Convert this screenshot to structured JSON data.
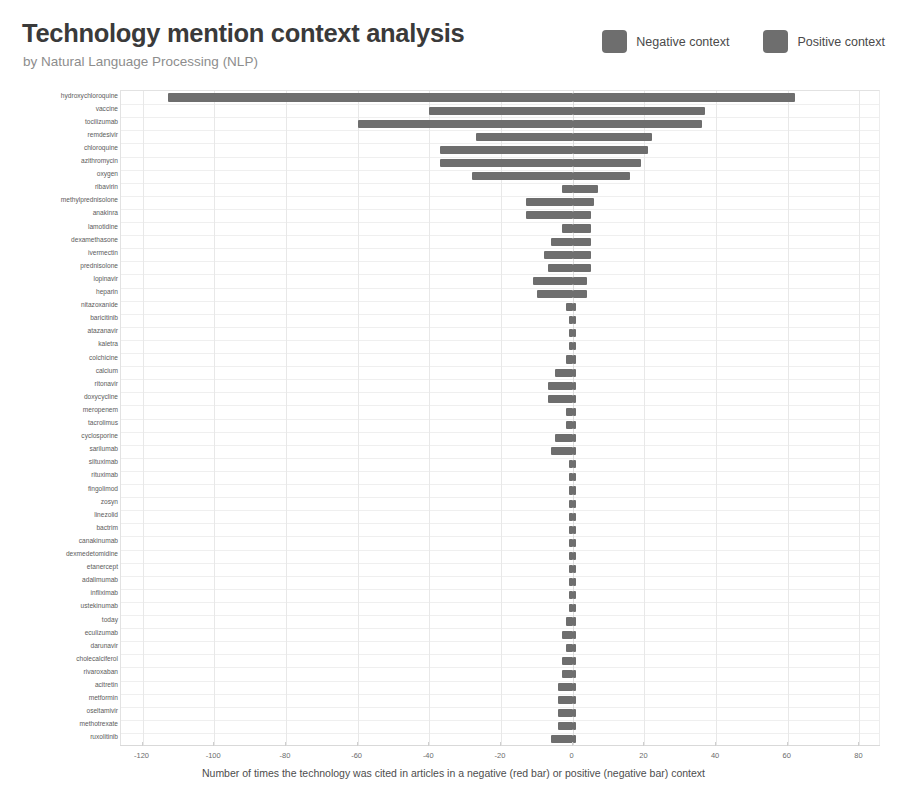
{
  "header": {
    "title": "Technology mention context analysis",
    "subtitle": "by Natural Language Processing (NLP)"
  },
  "legend": {
    "position": "top-right",
    "items": [
      {
        "label": "Negative context",
        "color": "#6e6e6e",
        "icon": "square-swatch"
      },
      {
        "label": "Positive context",
        "color": "#6e6e6e",
        "icon": "square-swatch"
      }
    ]
  },
  "chart_data": {
    "type": "bar",
    "orientation": "horizontal",
    "style": "diverging",
    "title": "Technology mention context analysis",
    "subtitle": "by Natural Language Processing (NLP)",
    "xlabel": "Number of times the technology was cited in articles in a negative (red bar) or positive (negative bar) context",
    "ylabel": "",
    "xlim": [
      -126,
      86
    ],
    "xticks": [
      -120,
      -100,
      -80,
      -60,
      -40,
      -20,
      0,
      20,
      40,
      60,
      80
    ],
    "grid": true,
    "legend": [
      "Negative context",
      "Positive context"
    ],
    "categories": [
      "hydroxychloroquine",
      "vaccine",
      "tocilizumab",
      "remdesivir",
      "chloroquine",
      "azithromycin",
      "oxygen",
      "ribavirin",
      "methylprednisolone",
      "anakinra",
      "lamotidine",
      "dexamethasone",
      "ivermectin",
      "prednisolone",
      "lopinavir",
      "heparin",
      "nitazoxanide",
      "baricitinib",
      "atazanavir",
      "kaletra",
      "colchicine",
      "calcium",
      "ritonavir",
      "doxycycline",
      "meropenem",
      "tacrolimus",
      "cyclosporine",
      "sarilumab",
      "siltuximab",
      "rituximab",
      "fingolimod",
      "zosyn",
      "linezolid",
      "bactrim",
      "canakinumab",
      "dexmedetomidine",
      "etanercept",
      "adalimumab",
      "infliximab",
      "ustekinumab",
      "today",
      "eculizumab",
      "darunavir",
      "cholecalciferol",
      "rivaroxaban",
      "acitretin",
      "metformin",
      "oseltamivir",
      "methotrexate",
      "ruxolitinib"
    ],
    "series": [
      {
        "name": "Negative context",
        "values": [
          -113,
          -40,
          -60,
          -27,
          -37,
          -37,
          -28,
          -3,
          -13,
          -13,
          -3,
          -6,
          -8,
          -7,
          -11,
          -10,
          -2,
          -1,
          -1,
          -1,
          -2,
          -5,
          -7,
          -7,
          -2,
          -2,
          -5,
          -6,
          -1,
          -1,
          -1,
          -1,
          -1,
          -1,
          -1,
          -1,
          -1,
          -1,
          -1,
          -1,
          -2,
          -3,
          -2,
          -3,
          -3,
          -4,
          -4,
          -4,
          -4,
          -6
        ]
      },
      {
        "name": "Positive context",
        "values": [
          62,
          37,
          36,
          22,
          21,
          19,
          16,
          7,
          6,
          5,
          5,
          5,
          5,
          5,
          4,
          4,
          1,
          1,
          1,
          1,
          1,
          1,
          1,
          1,
          1,
          1,
          1,
          1,
          1,
          1,
          1,
          1,
          1,
          1,
          1,
          1,
          1,
          1,
          1,
          1,
          1,
          1,
          1,
          1,
          1,
          1,
          1,
          1,
          1,
          1
        ]
      }
    ]
  },
  "axis_caption": "Number of times the technology was cited in articles in a negative (red bar) or positive (negative bar) context"
}
